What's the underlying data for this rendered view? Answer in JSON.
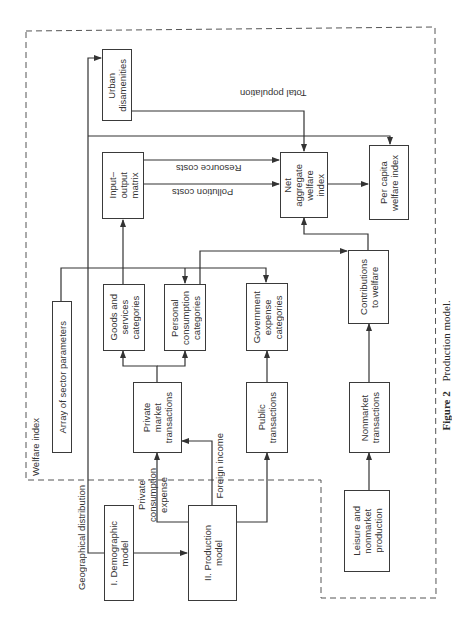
{
  "figure": {
    "number": "Figure 2",
    "title": "Production model."
  },
  "regions": {
    "welfare_index": "Welfare index"
  },
  "boxes": {
    "urban_disamenities": "Urban\ndisamenities",
    "input_output_matrix": "Input–\noutput\nmatrix",
    "net_aggregate_welfare_index": "Net\naggregate\nwelfare\nindex",
    "per_capita_welfare_index": "Per capita\nwelfare index",
    "array_of_sector_parameters": "Array of sector parameters",
    "goods_and_services_categories": "Goods and\nservices\ncategories",
    "personal_consumption_categories": "Personal\nconsumption\ncategories",
    "government_expense_categories": "Government\nexpense\ncategories",
    "contributions_to_welfare": "Contributions\nto welfare",
    "private_market_transactions": "Private\nmarket\ntransactions",
    "public_transactions": "Public\ntransactions",
    "nonmarket_transactions": "Nonmarket\ntransactions",
    "leisure_and_nonmarket_production": "Leisure and\nnonmarket\nproduction",
    "demographic_model": "I. Demographic\nmodel",
    "production_model": "II. Production\nmodel"
  },
  "edge_labels": {
    "total_population": "Total population",
    "resource_costs": "Resource costs",
    "pollution_costs": "Pollution costs",
    "geographical_distribution": "Geographical distribution",
    "private_consumption_expense": "Private\nconsumption\nexpense",
    "foreign_income": "Foreign income"
  },
  "edges": [
    {
      "from": "demographic_model",
      "to": "production_model",
      "label": ""
    },
    {
      "from": "demographic_model",
      "to": "urban_disamenities",
      "label": "Geographical distribution"
    },
    {
      "from": "demographic_model",
      "to": "per_capita_welfare_index",
      "label": "Total population"
    },
    {
      "from": "production_model",
      "to": "private_market_transactions",
      "label": "Private consumption expense"
    },
    {
      "from": "production_model",
      "to": "private_market_transactions",
      "label": "Foreign income"
    },
    {
      "from": "production_model",
      "to": "public_transactions",
      "label": ""
    },
    {
      "from": "private_market_transactions",
      "to": "goods_and_services_categories",
      "label": ""
    },
    {
      "from": "private_market_transactions",
      "to": "personal_consumption_categories",
      "label": ""
    },
    {
      "from": "public_transactions",
      "to": "government_expense_categories",
      "label": ""
    },
    {
      "from": "goods_and_services_categories",
      "to": "input_output_matrix",
      "label": ""
    },
    {
      "from": "array_of_sector_parameters",
      "to": "personal_consumption_categories",
      "label": ""
    },
    {
      "from": "array_of_sector_parameters",
      "to": "government_expense_categories",
      "label": ""
    },
    {
      "from": "personal_consumption_categories",
      "to": "contributions_to_welfare",
      "label": ""
    },
    {
      "from": "input_output_matrix",
      "to": "net_aggregate_welfare_index",
      "label": "Resource costs"
    },
    {
      "from": "input_output_matrix",
      "to": "net_aggregate_welfare_index",
      "label": "Pollution costs"
    },
    {
      "from": "urban_disamenities",
      "to": "net_aggregate_welfare_index",
      "label": ""
    },
    {
      "from": "contributions_to_welfare",
      "to": "net_aggregate_welfare_index",
      "label": ""
    },
    {
      "from": "net_aggregate_welfare_index",
      "to": "per_capita_welfare_index",
      "label": ""
    },
    {
      "from": "leisure_and_nonmarket_production",
      "to": "nonmarket_transactions",
      "label": ""
    },
    {
      "from": "nonmarket_transactions",
      "to": "contributions_to_welfare",
      "label": ""
    }
  ]
}
